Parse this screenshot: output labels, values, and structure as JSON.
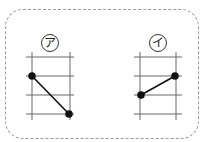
{
  "diagram": {
    "panels": [
      {
        "label": "ア",
        "points": [
          [
            32,
            76
          ],
          [
            69,
            114
          ]
        ]
      },
      {
        "label": "イ",
        "points": [
          [
            141,
            95
          ],
          [
            175,
            76
          ]
        ]
      }
    ],
    "colors": {
      "grid": "#555555",
      "frame": "#9a9a9a",
      "line": "#111111"
    }
  }
}
